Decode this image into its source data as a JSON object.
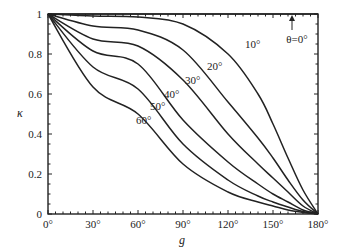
{
  "chart_data": {
    "type": "line",
    "title": "",
    "xlabel": "g",
    "ylabel": "κ",
    "xlim": [
      0,
      180
    ],
    "ylim": [
      0,
      1
    ],
    "grid": false,
    "legend": "none (inline curve labels)",
    "x_ticks": [
      "0°",
      "30°",
      "60°",
      "90°",
      "120°",
      "150°",
      "180°"
    ],
    "y_ticks": [
      "0",
      "0.2",
      "0.4",
      "0.6",
      "0.8",
      "1"
    ],
    "x": [
      0,
      30,
      60,
      90,
      120,
      140,
      150,
      160,
      170,
      180
    ],
    "series": [
      {
        "name": "θ=0°",
        "values": [
          1,
          1,
          1,
          1,
          1,
          1,
          1,
          1,
          1,
          1
        ]
      },
      {
        "name": "10°",
        "values": [
          1,
          0.99,
          0.985,
          0.95,
          0.8,
          0.6,
          0.45,
          0.28,
          0.12,
          0
        ]
      },
      {
        "name": "20°",
        "values": [
          1,
          0.94,
          0.92,
          0.82,
          0.56,
          0.38,
          0.28,
          0.17,
          0.07,
          0
        ]
      },
      {
        "name": "30°",
        "values": [
          1,
          0.875,
          0.84,
          0.67,
          0.4,
          0.25,
          0.18,
          0.11,
          0.04,
          0
        ]
      },
      {
        "name": "40°",
        "values": [
          1,
          0.815,
          0.75,
          0.47,
          0.26,
          0.15,
          0.1,
          0.06,
          0.02,
          0
        ]
      },
      {
        "name": "50°",
        "values": [
          1,
          0.735,
          0.625,
          0.35,
          0.17,
          0.09,
          0.06,
          0.035,
          0.012,
          0
        ]
      },
      {
        "name": "60°",
        "values": [
          1,
          0.635,
          0.5,
          0.25,
          0.11,
          0.06,
          0.04,
          0.02,
          0.008,
          0
        ]
      }
    ],
    "annotations": [
      {
        "text": "θ=0°",
        "note": "arrow pointing to top edge at g≈173°"
      },
      {
        "text": "10°"
      },
      {
        "text": "20°"
      },
      {
        "text": "30°"
      },
      {
        "text": "40°"
      },
      {
        "text": "50°"
      },
      {
        "text": "60°"
      }
    ]
  },
  "labels": {
    "xlabel": "g",
    "ylabel": "κ",
    "theta0": "θ=0°",
    "c10": "10°",
    "c20": "20°",
    "c30": "30°",
    "c40": "40°",
    "c50": "50°",
    "c60": "60°",
    "xt0": "0°",
    "xt30": "30°",
    "xt60": "60°",
    "xt90": "90°",
    "xt120": "120°",
    "xt150": "150°",
    "xt180": "180°",
    "yt0": "0",
    "yt02": "0.2",
    "yt04": "0.4",
    "yt06": "0.6",
    "yt08": "0.8",
    "yt1": "1"
  }
}
